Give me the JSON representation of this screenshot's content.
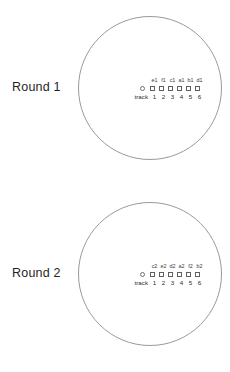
{
  "page": {
    "background_color": "#ffffff",
    "stroke_color": "#9a9a9a",
    "text_color": "#2b2b2b"
  },
  "panels": [
    {
      "id": "round-1",
      "label": "Round 1",
      "track_word": "track",
      "track_marker": "open-circle",
      "lane_labels": [
        "e1",
        "f1",
        "c1",
        "a1",
        "b1",
        "d1"
      ],
      "lane_numbers": [
        "1",
        "2",
        "3",
        "4",
        "5",
        "6"
      ]
    },
    {
      "id": "round-2",
      "label": "Round 2",
      "track_word": "track",
      "track_marker": "open-circle",
      "lane_labels": [
        "c2",
        "e2",
        "d2",
        "a2",
        "f2",
        "b2"
      ],
      "lane_numbers": [
        "1",
        "2",
        "3",
        "4",
        "5",
        "6"
      ]
    }
  ]
}
